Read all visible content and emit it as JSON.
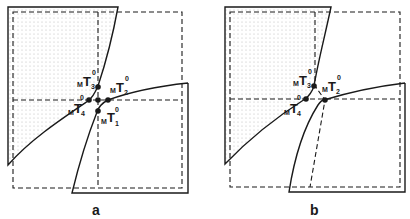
{
  "figure": {
    "panels": [
      {
        "id": "a",
        "label": "a",
        "points": [
          {
            "name": "T1",
            "pre": "M",
            "sym": "T",
            "sub": "1",
            "sup": "0"
          },
          {
            "name": "T2",
            "pre": "M",
            "sym": "T",
            "sub": "2",
            "sup": "0"
          },
          {
            "name": "T3",
            "pre": "M",
            "sym": "T",
            "sub": "3",
            "sup": "0"
          },
          {
            "name": "T4",
            "pre": "M",
            "sym": "T",
            "sub": "4",
            "sup": "0"
          }
        ]
      },
      {
        "id": "b",
        "label": "b",
        "points": [
          {
            "name": "T2",
            "pre": "M",
            "sym": "T",
            "sub": "2",
            "sup": "0"
          },
          {
            "name": "T3",
            "pre": "M",
            "sym": "T",
            "sub": "3",
            "sup": "0"
          },
          {
            "name": "T4",
            "pre": "M",
            "sym": "T",
            "sub": "4",
            "sup": "0"
          }
        ]
      }
    ],
    "colors": {
      "stroke": "#1a1a1a",
      "dots": "#bbbbbb",
      "background": "#ffffff"
    }
  }
}
